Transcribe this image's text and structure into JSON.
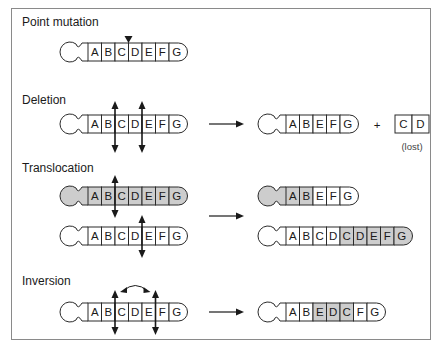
{
  "sections": [
    {
      "id": "point-mutation",
      "label": "Point mutation"
    },
    {
      "id": "deletion",
      "label": "Deletion"
    },
    {
      "id": "translocation",
      "label": "Translocation"
    },
    {
      "id": "inversion",
      "label": "Inversion"
    }
  ],
  "point_mutation": {
    "chromosome": {
      "genes": [
        "A",
        "B",
        "C",
        "D",
        "E",
        "F",
        "G"
      ],
      "shaded": []
    },
    "marker": "between C and D"
  },
  "deletion": {
    "before": {
      "genes": [
        "A",
        "B",
        "C",
        "D",
        "E",
        "F",
        "G"
      ],
      "breakpoints": [
        "B|C",
        "D|E"
      ]
    },
    "after": {
      "genes": [
        "A",
        "B",
        "E",
        "F",
        "G"
      ]
    },
    "plus_sign": "+",
    "fragment": {
      "genes": [
        "C",
        "D"
      ],
      "note": "(lost)"
    }
  },
  "translocation": {
    "before_top": {
      "genes": [
        "A",
        "B",
        "C",
        "D",
        "E",
        "F",
        "G"
      ],
      "shaded": true,
      "breakpoint": "B|C"
    },
    "before_bottom": {
      "genes": [
        "A",
        "B",
        "C",
        "D",
        "E",
        "F",
        "G"
      ],
      "shaded": false,
      "breakpoint": "D|E"
    },
    "after_top": {
      "genes": [
        "A",
        "B",
        "E",
        "F",
        "G"
      ],
      "shaded_genes": [
        "A",
        "B"
      ]
    },
    "after_bottom": {
      "genes": [
        "A",
        "B",
        "C",
        "D",
        "C",
        "D",
        "E",
        "F",
        "G"
      ],
      "shaded_genes_index": [
        4,
        5,
        6,
        7,
        8
      ]
    }
  },
  "inversion": {
    "before": {
      "genes": [
        "A",
        "B",
        "C",
        "D",
        "E",
        "F",
        "G"
      ],
      "breakpoints": [
        "B|C",
        "E|F"
      ]
    },
    "after": {
      "genes": [
        "A",
        "B",
        "E",
        "D",
        "C",
        "F",
        "G"
      ],
      "shaded_genes_index": [
        2,
        3,
        4
      ]
    }
  },
  "colors": {
    "outline": "#2a2a2a",
    "shade": "#cdcdcd",
    "frame": "#8a8a8a"
  }
}
